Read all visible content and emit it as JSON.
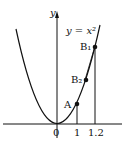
{
  "figure": {
    "curve_label": "y = x²",
    "axis_y_label": "y",
    "points": [
      {
        "name": "A",
        "label": "A",
        "x": 1
      },
      {
        "name": "B2",
        "label": "B₂"
      },
      {
        "name": "B1",
        "label": "B₁",
        "x": 1.2
      }
    ],
    "x_ticks": [
      "0",
      "1",
      "1.2"
    ]
  }
}
